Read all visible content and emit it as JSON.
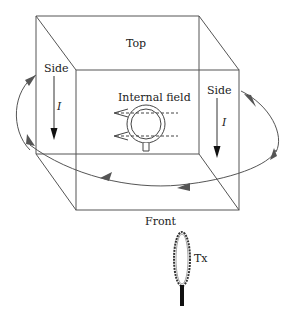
{
  "diagram": {
    "labels": {
      "top": "Top",
      "front": "Front",
      "side_left": "Side",
      "side_right": "Side",
      "current_left": "I",
      "current_right": "I",
      "internal_field": "Internal field",
      "receiver": "Rx",
      "transmitter": "Tx"
    },
    "colors": {
      "line": "#555555",
      "arrow": "#444444",
      "text": "#222222"
    }
  }
}
